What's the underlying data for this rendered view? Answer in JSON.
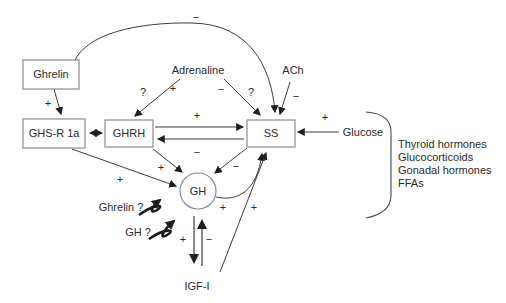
{
  "diagram": {
    "nodes": {
      "ghrelin": {
        "label": "Ghrelin"
      },
      "ghs_r1a": {
        "label": "GHS-R 1a"
      },
      "ghrh": {
        "label": "GHRH"
      },
      "ss": {
        "label": "SS"
      },
      "gh": {
        "label": "GH"
      },
      "igf1": {
        "label": "IGF-I"
      },
      "adrenaline": {
        "label": "Adrenaline"
      },
      "ach": {
        "label": "ACh"
      },
      "glucose": {
        "label": "Glucose"
      },
      "ghrelin_question": {
        "label": "Ghrelin ?"
      },
      "gh_question": {
        "label": "GH ?"
      }
    },
    "signs": {
      "long_loop_sign": "−",
      "ghrelin_ghsr_sign": "+",
      "adrenaline_ghrh_q": "?",
      "adrenaline_ghrh_sign": "+",
      "adrenaline_ss_sign": "−",
      "adrenaline_ss_q": "?",
      "ach_ss_sign": "−",
      "ghrh_ss_sign": "+",
      "ss_ghrh_sign": "−",
      "glucose_ss_sign": "+",
      "ghsr_gh_sign": "+",
      "ghrh_gh_sign": "+",
      "ss_gh_sign": "−",
      "gh_ss_sign": "+",
      "igf_ss_sign": "+",
      "gh_igf_sign": "+",
      "igf_gh_sign": "−"
    },
    "right_group": {
      "items": [
        "Thyroid hormones",
        "Glucocorticoids",
        "Gonadal hormones",
        "FFAs"
      ]
    },
    "colors": {
      "background": "#ffffff",
      "line": "#3d3d3d",
      "box_border": "#8c8c8c",
      "text": "#2b2b2b",
      "gray_arrow": "#8a8a8a"
    }
  }
}
